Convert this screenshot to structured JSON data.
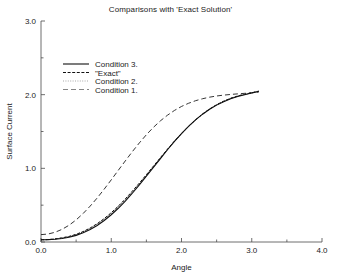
{
  "chart_data": {
    "type": "line",
    "title": "Comparisons with 'Exact Solution'",
    "xlabel": "Angle",
    "ylabel": "Surface Current",
    "xlim": [
      0.0,
      4.0
    ],
    "ylim": [
      0.0,
      3.0
    ],
    "xticks": [
      "0.0",
      "1.0",
      "2.0",
      "3.0",
      "4.0"
    ],
    "xtick_values": [
      0.0,
      1.0,
      2.0,
      3.0,
      4.0
    ],
    "yticks": [
      "0.0",
      "1.0",
      "2.0",
      "3.0"
    ],
    "ytick_values": [
      0.0,
      1.0,
      2.0,
      3.0
    ],
    "x_minor_ticks": [
      0.5,
      1.5,
      2.5,
      3.5
    ],
    "y_minor_ticks": [
      0.5,
      1.5,
      2.5
    ],
    "grid": false,
    "legend_position": "upper-left-inside",
    "x": [
      0.0,
      0.1,
      0.2,
      0.3,
      0.4,
      0.5,
      0.6,
      0.7,
      0.8,
      0.9,
      1.0,
      1.1,
      1.2,
      1.3,
      1.4,
      1.5,
      1.6,
      1.7,
      1.8,
      1.9,
      2.0,
      2.1,
      2.2,
      2.3,
      2.4,
      2.5,
      2.6,
      2.7,
      2.8,
      2.9,
      3.0,
      3.1
    ],
    "series": [
      {
        "name": "Condition 3.",
        "style": "solid",
        "color": "#111111",
        "values": [
          0.03,
          0.032,
          0.038,
          0.048,
          0.065,
          0.09,
          0.125,
          0.17,
          0.225,
          0.292,
          0.37,
          0.458,
          0.556,
          0.662,
          0.775,
          0.893,
          1.013,
          1.133,
          1.252,
          1.366,
          1.472,
          1.57,
          1.658,
          1.735,
          1.802,
          1.858,
          1.905,
          1.944,
          1.975,
          2.0,
          2.022,
          2.045
        ]
      },
      {
        "name": "\"Exact\"",
        "style": "dashed",
        "color": "#111111",
        "values": [
          0.03,
          0.033,
          0.042,
          0.056,
          0.076,
          0.104,
          0.142,
          0.19,
          0.249,
          0.318,
          0.398,
          0.487,
          0.585,
          0.69,
          0.8,
          0.914,
          1.03,
          1.146,
          1.26,
          1.37,
          1.474,
          1.571,
          1.659,
          1.738,
          1.806,
          1.864,
          1.912,
          1.951,
          1.982,
          2.006,
          2.026,
          2.048
        ]
      },
      {
        "name": "Condition 2.",
        "style": "dotted",
        "color": "#9a9a9a",
        "values": [
          0.03,
          0.033,
          0.041,
          0.054,
          0.073,
          0.1,
          0.137,
          0.184,
          0.241,
          0.309,
          0.388,
          0.476,
          0.573,
          0.678,
          0.789,
          0.904,
          1.021,
          1.138,
          1.253,
          1.364,
          1.469,
          1.567,
          1.656,
          1.736,
          1.805,
          1.863,
          1.911,
          1.95,
          1.981,
          2.005,
          2.025,
          2.047
        ]
      },
      {
        "name": "Condition 1.",
        "style": "longdash",
        "color": "#6f6f6f",
        "values": [
          0.1,
          0.108,
          0.132,
          0.172,
          0.228,
          0.3,
          0.387,
          0.487,
          0.598,
          0.718,
          0.844,
          0.973,
          1.101,
          1.226,
          1.345,
          1.456,
          1.556,
          1.645,
          1.721,
          1.786,
          1.84,
          1.883,
          1.918,
          1.945,
          1.966,
          1.982,
          1.994,
          2.003,
          2.011,
          2.018,
          2.026,
          2.036
        ]
      }
    ],
    "legend": [
      {
        "label": "Condition 3.",
        "style": "solid"
      },
      {
        "label": "\"Exact\"",
        "style": "dashed"
      },
      {
        "label": "Condition 2.",
        "style": "dotted"
      },
      {
        "label": "Condition 1.",
        "style": "longdash"
      }
    ]
  }
}
